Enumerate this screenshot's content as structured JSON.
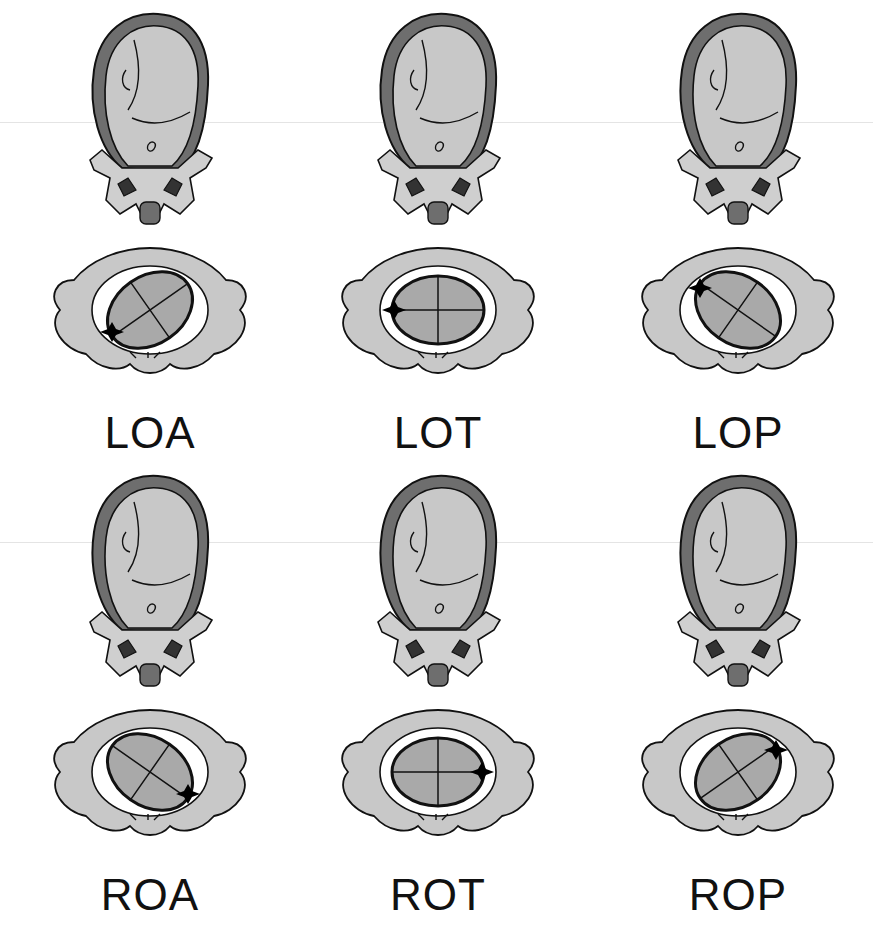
{
  "diagram": {
    "type": "fetal-occiput-positions",
    "colors": {
      "fill": "#c8c8c8",
      "uterus_wall": "#707070",
      "outline": "#111111",
      "skull_stipple": "#a9a9a9",
      "fontanelle": "#000000",
      "background": "#ffffff"
    },
    "rows": [
      {
        "panels": [
          {
            "label": "LOA",
            "occiput": "left-anterior",
            "skull_angle": -35,
            "fontanelle": "bottom-left"
          },
          {
            "label": "LOT",
            "occiput": "left-transverse",
            "skull_angle": 0,
            "fontanelle": "left"
          },
          {
            "label": "LOP",
            "occiput": "left-posterior",
            "skull_angle": 35,
            "fontanelle": "top-left"
          }
        ]
      },
      {
        "panels": [
          {
            "label": "ROA",
            "occiput": "right-anterior",
            "skull_angle": 35,
            "fontanelle": "bottom-right"
          },
          {
            "label": "ROT",
            "occiput": "right-transverse",
            "skull_angle": 0,
            "fontanelle": "right"
          },
          {
            "label": "ROP",
            "occiput": "right-posterior",
            "skull_angle": -35,
            "fontanelle": "top-right"
          }
        ]
      }
    ]
  }
}
